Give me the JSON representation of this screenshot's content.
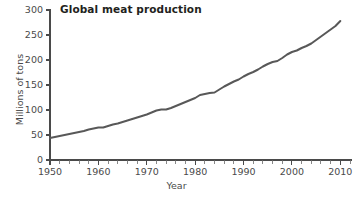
{
  "chart_data": {
    "type": "line",
    "title": "Global meat production",
    "xlabel": "Year",
    "ylabel": "Millions of tons",
    "xlim": [
      1950,
      2012
    ],
    "ylim": [
      0,
      300
    ],
    "xticks": [
      1950,
      1960,
      1970,
      1980,
      1990,
      2000,
      2010
    ],
    "xtick_labels": [
      "1950",
      "1960",
      "1970",
      "1980",
      "1990",
      "2000",
      "2010"
    ],
    "yticks": [
      0,
      50,
      100,
      150,
      200,
      250,
      300
    ],
    "ytick_labels": [
      "0",
      "50",
      "100",
      "150",
      "200",
      "250",
      "300"
    ],
    "minor_xtick_interval": 2,
    "grid": false,
    "legend": false,
    "series": [
      {
        "name": "Global meat production",
        "color": "#585858",
        "line_width": 2,
        "x": [
          1950,
          1951,
          1952,
          1953,
          1954,
          1955,
          1956,
          1957,
          1958,
          1959,
          1960,
          1961,
          1962,
          1963,
          1964,
          1965,
          1966,
          1967,
          1968,
          1969,
          1970,
          1971,
          1972,
          1973,
          1974,
          1975,
          1976,
          1977,
          1978,
          1979,
          1980,
          1981,
          1982,
          1983,
          1984,
          1985,
          1986,
          1987,
          1988,
          1989,
          1990,
          1991,
          1992,
          1993,
          1994,
          1995,
          1996,
          1997,
          1998,
          1999,
          2000,
          2001,
          2002,
          2003,
          2004,
          2005,
          2006,
          2007,
          2008,
          2009,
          2010
        ],
        "values": [
          44,
          46,
          48,
          50,
          52,
          54,
          56,
          58,
          61,
          63,
          65,
          65,
          68,
          71,
          73,
          76,
          79,
          82,
          85,
          88,
          91,
          95,
          99,
          101,
          101,
          104,
          108,
          112,
          116,
          120,
          124,
          130,
          132,
          134,
          135,
          141,
          147,
          152,
          157,
          161,
          167,
          172,
          176,
          181,
          187,
          192,
          196,
          198,
          204,
          211,
          216,
          219,
          224,
          228,
          233,
          240,
          247,
          254,
          261,
          268,
          278
        ]
      }
    ]
  },
  "colors": {
    "line": "#585858",
    "axis": "#4a4a4a",
    "title": "#231f20",
    "background": "#ffffff"
  }
}
